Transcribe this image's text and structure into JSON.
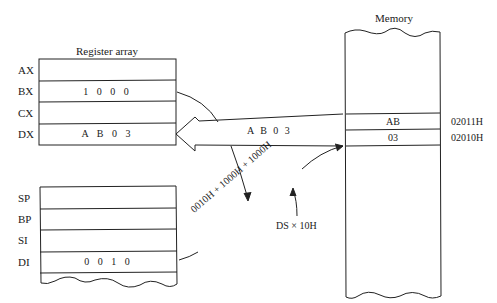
{
  "register_array": {
    "title": "Register array",
    "top_group": [
      {
        "name": "AX",
        "value": ""
      },
      {
        "name": "BX",
        "value": "1 0 0 0"
      },
      {
        "name": "CX",
        "value": ""
      },
      {
        "name": "DX",
        "value": "A B 0 3"
      }
    ],
    "bottom_group": [
      {
        "name": "SP",
        "value": ""
      },
      {
        "name": "BP",
        "value": ""
      },
      {
        "name": "SI",
        "value": ""
      },
      {
        "name": "DI",
        "value": "0 0 1 0"
      }
    ]
  },
  "memory": {
    "title": "Memory",
    "cells": [
      {
        "value": "AB",
        "address": "02011H"
      },
      {
        "value": "03",
        "address": "02010H"
      }
    ]
  },
  "data_arrow": {
    "label": "A B 0 3"
  },
  "address_calc": {
    "expression": "0010H + 1000H + 1000H",
    "segment_note": "DS × 10H"
  }
}
